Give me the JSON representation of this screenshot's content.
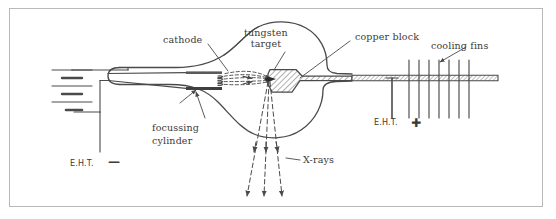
{
  "figure": {
    "type": "diagram",
    "border_color": "#b9b9b9",
    "ink_color": "#4a4a4a",
    "background": "#ffffff"
  },
  "labels": {
    "cathode": "cathode",
    "tungsten_target_line1": "tungsten",
    "tungsten_target_line2": "target",
    "copper_block": "copper block",
    "cooling_fins": "cooling fins",
    "focussing_line1": "focussing",
    "focussing_line2": "cylinder",
    "xrays": "X-rays",
    "eht_negative": "E.H.T.",
    "eht_negative_sign": "—",
    "eht_positive": "E.H.T.",
    "eht_positive_sign": "✚"
  },
  "components": {
    "battery": {
      "name": "battery-symbol",
      "cells": 3
    },
    "cooling_fins": {
      "count": 7
    },
    "electron_beam": {
      "name": "electron-beam",
      "style": "dashed-converging",
      "rays": 5
    },
    "xray_beam": {
      "name": "xray-beam",
      "style": "dashed-diverging",
      "rays": 3
    },
    "envelope": {
      "name": "glass-envelope",
      "shape": "bulb-with-necks"
    },
    "anode": {
      "name": "copper-anode-rod",
      "fill": "hatched"
    },
    "target": {
      "name": "tungsten-target",
      "fill": "hatched-wedge"
    }
  }
}
